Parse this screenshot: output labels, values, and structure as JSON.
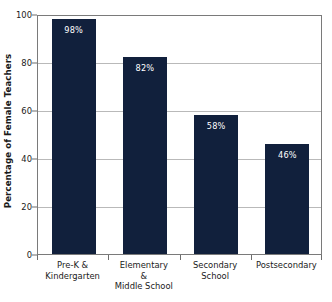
{
  "chart_data": {
    "type": "bar",
    "title": "",
    "subtitle": "",
    "xlabel": "",
    "ylabel": "Percentage of Female Teachers",
    "categories": [
      "Pre-K & Kindergarten",
      "Elementary & Middle School",
      "Secondary School",
      "Postsecondary"
    ],
    "category_lines": [
      [
        "Pre-K &",
        "Kindergarten"
      ],
      [
        "Elementary",
        "&",
        "Middle School"
      ],
      [
        "Secondary",
        "School"
      ],
      [
        "Postsecondary"
      ]
    ],
    "values": [
      98,
      82,
      58,
      46
    ],
    "data_labels": [
      "98%",
      "82%",
      "58%",
      "46%"
    ],
    "ylim": [
      0,
      100
    ],
    "yticks": [
      0,
      20,
      40,
      60,
      80,
      100
    ],
    "ytick_labels": [
      "0",
      "20",
      "40",
      "60",
      "80",
      "100"
    ],
    "grid": true,
    "grid_axis": "y",
    "legend": false,
    "legend_position": "none",
    "bar_color": "#11203c",
    "data_label_color": "#ffffff",
    "gridline_color": "#b9b9b9",
    "axis_color": "#7a7a7a",
    "background_color": "#ffffff"
  }
}
